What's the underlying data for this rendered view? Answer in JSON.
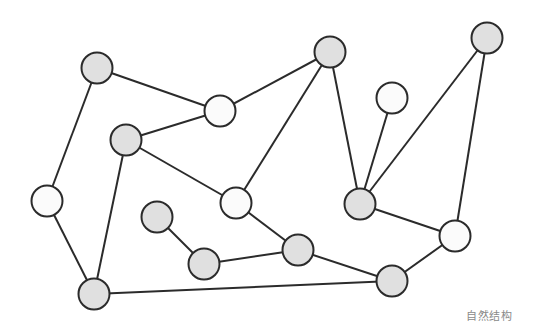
{
  "caption": "自然结构",
  "colors": {
    "background": "#ffffff",
    "stroke": "#2b2b2b",
    "gray_fill": "#e0e0e0",
    "white_fill": "#fbfbfb",
    "caption": "#8a8a8a"
  },
  "node_radius": 15.5,
  "nodes": [
    {
      "id": "A",
      "x": 97,
      "y": 68,
      "fill": "gray"
    },
    {
      "id": "B",
      "x": 220,
      "y": 111,
      "fill": "white"
    },
    {
      "id": "C",
      "x": 126,
      "y": 140,
      "fill": "gray"
    },
    {
      "id": "D",
      "x": 157,
      "y": 217,
      "fill": "gray"
    },
    {
      "id": "E",
      "x": 47,
      "y": 201,
      "fill": "white"
    },
    {
      "id": "F",
      "x": 330,
      "y": 52,
      "fill": "gray"
    },
    {
      "id": "G",
      "x": 392,
      "y": 98,
      "fill": "white"
    },
    {
      "id": "H",
      "x": 236,
      "y": 203,
      "fill": "white"
    },
    {
      "id": "I",
      "x": 360,
      "y": 204,
      "fill": "gray"
    },
    {
      "id": "J",
      "x": 455,
      "y": 236,
      "fill": "white"
    },
    {
      "id": "K",
      "x": 487,
      "y": 38,
      "fill": "gray"
    },
    {
      "id": "L",
      "x": 298,
      "y": 250,
      "fill": "gray"
    },
    {
      "id": "M",
      "x": 94,
      "y": 294,
      "fill": "gray"
    },
    {
      "id": "N",
      "x": 392,
      "y": 281,
      "fill": "gray"
    },
    {
      "id": "P",
      "x": 204,
      "y": 264,
      "fill": "gray"
    }
  ],
  "edges": [
    [
      "A",
      "B"
    ],
    [
      "A",
      "E"
    ],
    [
      "B",
      "C"
    ],
    [
      "B",
      "F"
    ],
    [
      "C",
      "H"
    ],
    [
      "C",
      "M"
    ],
    [
      "E",
      "M"
    ],
    [
      "F",
      "H"
    ],
    [
      "F",
      "I"
    ],
    [
      "G",
      "I"
    ],
    [
      "K",
      "I"
    ],
    [
      "K",
      "J"
    ],
    [
      "I",
      "J"
    ],
    [
      "J",
      "N"
    ],
    [
      "H",
      "L"
    ],
    [
      "L",
      "N"
    ],
    [
      "D",
      "P"
    ],
    [
      "P",
      "L"
    ],
    [
      "M",
      "N"
    ]
  ]
}
